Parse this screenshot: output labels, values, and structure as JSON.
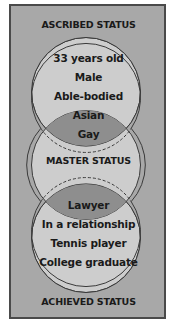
{
  "diagram": {
    "type": "three-circle-venn",
    "top_label": "ASCRIBED STATUS",
    "middle_label": "MASTER STATUS",
    "bottom_label": "ACHIEVED STATUS",
    "top_circle_items": [
      "33 years old",
      "Male",
      "Able-bodied"
    ],
    "top_overlap_items": [
      "Asian",
      "Gay"
    ],
    "bottom_overlap_items": [
      "Lawyer"
    ],
    "bottom_circle_items": [
      "In a relationship",
      "Tennis player",
      "College graduate"
    ]
  },
  "colors": {
    "background": "#a8a8a8",
    "circle_fill": "#cdcdcd",
    "overlap_fill": "#8e8e8e",
    "border": "#4a4a4a",
    "text": "#1a1a1a"
  }
}
